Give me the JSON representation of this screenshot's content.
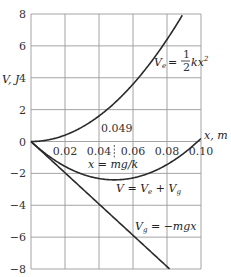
{
  "chart_data": {
    "type": "line",
    "title": "",
    "xlabel": "x, m",
    "ylabel": "V, J",
    "xlim": [
      0,
      0.1
    ],
    "ylim": [
      -8,
      8
    ],
    "grid": true,
    "x_ticks": [
      "0.02",
      "0.04",
      "0.06",
      "0.08",
      "0.10"
    ],
    "y_ticks": [
      "8",
      "6",
      "4",
      "2",
      "0",
      "−2",
      "−4",
      "−6",
      "−8"
    ],
    "parameters": {
      "k": 2000,
      "mg": 98.1
    },
    "series": [
      {
        "name": "Ve = 1/2 kx^2",
        "label": "V_e = ½ kx²",
        "x": [
          0,
          0.01,
          0.02,
          0.03,
          0.04,
          0.05,
          0.06,
          0.07,
          0.08,
          0.0894
        ],
        "values": [
          0,
          0.1,
          0.4,
          0.9,
          1.6,
          2.5,
          3.6,
          4.9,
          6.4,
          8.0
        ]
      },
      {
        "name": "Vg = -mgx",
        "label": "V_g = −mgx",
        "x": [
          0,
          0.02,
          0.04,
          0.06,
          0.08,
          0.0816
        ],
        "values": [
          0,
          -1.96,
          -3.92,
          -5.89,
          -7.85,
          -8.0
        ]
      },
      {
        "name": "V = Ve + Vg",
        "label": "V = V_e + V_g",
        "x": [
          0,
          0.01,
          0.02,
          0.03,
          0.04,
          0.049,
          0.06,
          0.07,
          0.08,
          0.09,
          0.1
        ],
        "values": [
          0,
          -0.88,
          -1.56,
          -2.04,
          -2.32,
          -2.41,
          -2.29,
          -1.97,
          -1.45,
          -0.73,
          0.19
        ]
      }
    ],
    "annotations": [
      {
        "text": "0.049",
        "x": 0.049,
        "note": "dashed vertical marker at minimum of V"
      },
      {
        "text": "x = mg/k",
        "x": 0.049
      }
    ]
  },
  "labels": {
    "ylabel": "V, J",
    "xlabel": "x, m",
    "min_value": "0.049",
    "min_formula": "x = mg/k",
    "ve_label_lhs": "V",
    "ve_label_sub": "e",
    "ve_label_rhs": "= ",
    "ve_frac_num": "1",
    "ve_frac_den": "2",
    "ve_tail": "kx",
    "ve_sup": "2",
    "v_label": "V = V",
    "v_sub1": "e",
    "v_mid": " + V",
    "v_sub2": "g",
    "vg_label_lhs": "V",
    "vg_sub": "g",
    "vg_rhs": " = −mgx"
  },
  "ticks": {
    "y": [
      "8",
      "6",
      "4",
      "2",
      "0",
      "−2",
      "−4",
      "−6",
      "−8"
    ],
    "x": [
      "0.02",
      "0.04",
      "0.06",
      "0.08",
      "0.10"
    ]
  }
}
